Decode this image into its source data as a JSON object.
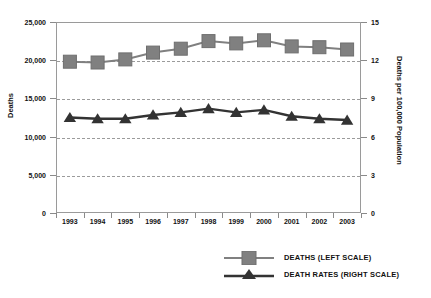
{
  "chart_data": {
    "type": "line",
    "title": "",
    "xlabel": "",
    "ylabel": "Deaths",
    "ylabel_right": "Deaths per 100,000 Population",
    "categories": [
      "1993",
      "1994",
      "1995",
      "1996",
      "1997",
      "1998",
      "1999",
      "2000",
      "2001",
      "2002",
      "2003"
    ],
    "ylim": [
      0,
      25000
    ],
    "ylim_right": [
      0,
      15
    ],
    "yticks": [
      "0",
      "5,000",
      "10,000",
      "15,000",
      "20,000",
      "25,000"
    ],
    "ytick_values": [
      0,
      5000,
      10000,
      15000,
      20000,
      25000
    ],
    "yticks_right": [
      "0",
      "3",
      "6",
      "9",
      "12",
      "15"
    ],
    "ytick_values_right": [
      0,
      3,
      6,
      9,
      12,
      15
    ],
    "grid": true,
    "legend_position": "bottom-right",
    "series": [
      {
        "name": "DEATHS (LEFT SCALE)",
        "axis": "left",
        "marker": "square",
        "color": "#808080",
        "values": [
          19800,
          19700,
          20100,
          21000,
          21500,
          22500,
          22200,
          22600,
          21800,
          21700,
          21400
        ]
      },
      {
        "name": "DEATH RATES (RIGHT SCALE)",
        "axis": "right",
        "marker": "triangle",
        "color": "#333333",
        "values": [
          7.5,
          7.4,
          7.4,
          7.7,
          7.9,
          8.2,
          7.9,
          8.1,
          7.6,
          7.4,
          7.3
        ]
      }
    ]
  },
  "legend": {
    "items": [
      {
        "label": "DEATHS (LEFT SCALE)",
        "marker": "square",
        "color": "#808080"
      },
      {
        "label": "DEATH RATES (RIGHT SCALE)",
        "marker": "triangle",
        "color": "#333333"
      }
    ]
  },
  "axes": {
    "left_title": "Deaths",
    "right_title": "Deaths per 100,000 Population"
  }
}
